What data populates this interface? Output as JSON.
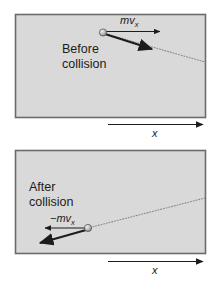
{
  "figure": {
    "title": "",
    "background_color": "#ffffff",
    "panel_fill": "#d9d9d9",
    "panel_border_color": "#6b6b6b",
    "ink_color": "#1c1c1c",
    "ball_fill": "#b4b4b4",
    "dotted_color": "#8a8a8a"
  },
  "panels": [
    {
      "id": "before",
      "caption_line1": "Before",
      "caption_line2": "collision",
      "vector_label_prefix": "",
      "vector_label_base": "mv",
      "vector_label_subscript": "x",
      "axis_label": "x",
      "ball_label": "ball",
      "momentum_arrow_name": "momentum-x-arrow",
      "velocity_arrow_name": "momentum-vector-arrow",
      "trajectory_name": "trajectory-dotted-line"
    },
    {
      "id": "after",
      "caption_line1": "After",
      "caption_line2": "collision",
      "vector_label_prefix": "−",
      "vector_label_base": "mv",
      "vector_label_subscript": "x",
      "axis_label": "x",
      "ball_label": "ball",
      "momentum_arrow_name": "momentum-x-arrow",
      "velocity_arrow_name": "momentum-vector-arrow",
      "trajectory_name": "trajectory-dotted-line"
    }
  ]
}
